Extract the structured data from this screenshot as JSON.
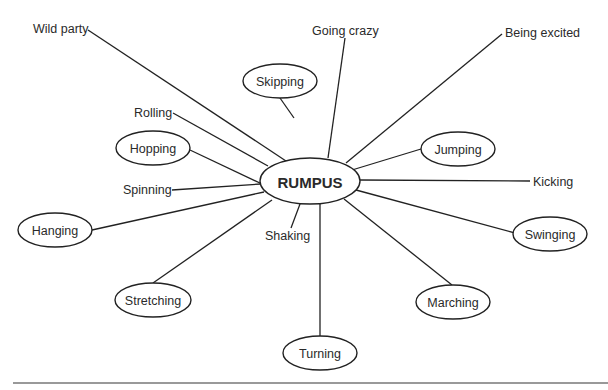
{
  "diagram": {
    "type": "word-web",
    "center": {
      "label": "RUMPUS",
      "cx": 310,
      "cy": 181,
      "rx": 50,
      "ry": 23
    },
    "bubbles": [
      {
        "id": "skipping",
        "label": "Skipping",
        "cx": 280,
        "cy": 81,
        "rx": 37,
        "ry": 17,
        "edge": [
          294,
          118,
          280,
          98
        ]
      },
      {
        "id": "hopping",
        "label": "Hopping",
        "cx": 153,
        "cy": 148,
        "rx": 37,
        "ry": 17,
        "edge": [
          190,
          150,
          262,
          184
        ]
      },
      {
        "id": "hanging",
        "label": "Hanging",
        "cx": 55,
        "cy": 230,
        "rx": 37,
        "ry": 17,
        "edge": [
          92,
          230,
          264,
          192
        ]
      },
      {
        "id": "stretching",
        "label": "Stretching",
        "cx": 153,
        "cy": 300,
        "rx": 38,
        "ry": 17,
        "edge": [
          153,
          283,
          272,
          200
        ]
      },
      {
        "id": "turning",
        "label": "Turning",
        "cx": 320,
        "cy": 353,
        "rx": 37,
        "ry": 17,
        "edge": [
          320,
          336,
          320,
          204
        ]
      },
      {
        "id": "marching",
        "label": "Marching",
        "cx": 453,
        "cy": 302,
        "rx": 37,
        "ry": 17,
        "edge": [
          452,
          285,
          344,
          199
        ]
      },
      {
        "id": "swinging",
        "label": "Swinging",
        "cx": 550,
        "cy": 234,
        "rx": 37,
        "ry": 17,
        "edge": [
          515,
          233,
          356,
          190
        ]
      },
      {
        "id": "jumping",
        "label": "Jumping",
        "cx": 458,
        "cy": 149,
        "rx": 37,
        "ry": 17,
        "edge": [
          421,
          149,
          352,
          170
        ]
      }
    ],
    "free_labels": [
      {
        "id": "wild-party",
        "label": "Wild party",
        "x": 33,
        "y": 33,
        "anchor": "start",
        "edge": [
          88,
          30,
          286,
          161
        ]
      },
      {
        "id": "going-crazy",
        "label": "Going crazy",
        "x": 312,
        "y": 35,
        "anchor": "start",
        "edge": [
          345,
          38,
          328,
          158
        ]
      },
      {
        "id": "being-excited",
        "label": "Being excited",
        "x": 505,
        "y": 37,
        "anchor": "start",
        "edge": [
          502,
          34,
          346,
          163
        ]
      },
      {
        "id": "rolling",
        "label": "Rolling",
        "x": 134,
        "y": 117,
        "anchor": "start",
        "edge": [
          173,
          113,
          268,
          166
        ]
      },
      {
        "id": "spinning",
        "label": "Spinning",
        "x": 123,
        "y": 194,
        "anchor": "start",
        "edge": [
          172,
          190,
          261,
          184
        ]
      },
      {
        "id": "kicking",
        "label": "Kicking",
        "x": 533,
        "y": 186,
        "anchor": "start",
        "edge": [
          530,
          181,
          360,
          180
        ]
      },
      {
        "id": "shaking",
        "label": "Shaking",
        "x": 265,
        "y": 240,
        "anchor": "start",
        "edge": [
          291,
          228,
          300,
          204
        ]
      }
    ]
  }
}
